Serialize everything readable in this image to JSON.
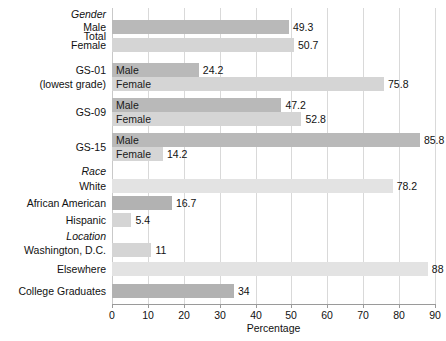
{
  "chart_data": {
    "type": "bar",
    "orientation": "horizontal",
    "title": "",
    "xlabel": "Percentage",
    "ylabel": "",
    "xlim": [
      0,
      90
    ],
    "xticks": [
      0,
      10,
      20,
      30,
      40,
      50,
      60,
      70,
      80,
      90
    ],
    "grid": true,
    "legend": "none",
    "colors": {
      "dark": "#b9b9b9",
      "light": "#d5d5d5",
      "extra_light": "#e3e3e3",
      "mid": "#b2b2b2",
      "gridline": "#d9d9d9",
      "axis": "#9a9a9a"
    },
    "rows": [
      {
        "kind": "group",
        "label": "Gender"
      },
      {
        "kind": "bar",
        "label": "Male",
        "group_label": "Total",
        "value": 49.3,
        "value_text": "49.3",
        "shade": "dark",
        "inbar": ""
      },
      {
        "kind": "bar",
        "label": "Female",
        "group_label": "",
        "value": 50.7,
        "value_text": "50.7",
        "shade": "light",
        "inbar": ""
      },
      {
        "kind": "bar",
        "label": "",
        "group_label": "GS-01",
        "value": 24.2,
        "value_text": "24.2",
        "shade": "dark",
        "inbar": "Male"
      },
      {
        "kind": "bar",
        "label": "",
        "group_label": "(lowest grade)",
        "value": 75.8,
        "value_text": "75.8",
        "shade": "light",
        "inbar": "Female"
      },
      {
        "kind": "bar",
        "label": "",
        "group_label": "GS-09",
        "value": 47.2,
        "value_text": "47.2",
        "shade": "dark",
        "inbar": "Male"
      },
      {
        "kind": "bar",
        "label": "",
        "group_label": "",
        "value": 52.8,
        "value_text": "52.8",
        "shade": "light",
        "inbar": "Female"
      },
      {
        "kind": "bar",
        "label": "",
        "group_label": "GS-15",
        "value": 85.8,
        "value_text": "85.8",
        "shade": "dark",
        "inbar": "Male"
      },
      {
        "kind": "bar",
        "label": "",
        "group_label": "",
        "value": 14.2,
        "value_text": "14.2",
        "shade": "light",
        "inbar": "Female"
      },
      {
        "kind": "group",
        "label": "Race"
      },
      {
        "kind": "bar",
        "label": "White",
        "group_label": "",
        "value": 78.2,
        "value_text": "78.2",
        "shade": "xlight",
        "inbar": ""
      },
      {
        "kind": "bar",
        "label": "African American",
        "group_label": "",
        "value": 16.7,
        "value_text": "16.7",
        "shade": "mid",
        "inbar": ""
      },
      {
        "kind": "bar",
        "label": "Hispanic",
        "group_label": "",
        "value": 5.4,
        "value_text": "5.4",
        "shade": "light",
        "inbar": ""
      },
      {
        "kind": "group",
        "label": "Location"
      },
      {
        "kind": "bar",
        "label": "Washington, D.C.",
        "group_label": "",
        "value": 11,
        "value_text": "11",
        "shade": "light",
        "inbar": ""
      },
      {
        "kind": "bar",
        "label": "Elsewhere",
        "group_label": "",
        "value": 88,
        "value_text": "88",
        "shade": "xlight",
        "inbar": ""
      },
      {
        "kind": "bar",
        "label": "College Graduates",
        "group_label": "",
        "value": 34,
        "value_text": "34",
        "shade": "mid",
        "inbar": ""
      }
    ]
  },
  "axis": {
    "x_title": "Percentage",
    "tick_labels": [
      "0",
      "10",
      "20",
      "30",
      "40",
      "50",
      "60",
      "70",
      "80",
      "90"
    ]
  },
  "category_labels": {
    "gender_group": "Gender",
    "total": "Total",
    "male": "Male",
    "female": "Female",
    "gs01": "GS-01",
    "gs01_sub": "(lowest grade)",
    "gs09": "GS-09",
    "gs15": "GS-15",
    "race_group": "Race",
    "white": "White",
    "african_american": "African American",
    "hispanic": "Hispanic",
    "location_group": "Location",
    "washington_dc": "Washington, D.C.",
    "elsewhere": "Elsewhere",
    "college_graduates": "College Graduates"
  }
}
